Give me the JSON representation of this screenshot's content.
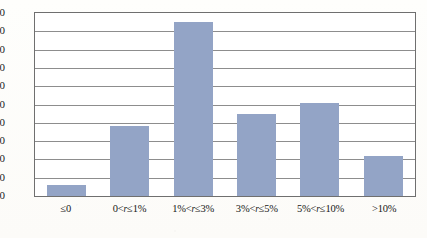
{
  "chart_data": {
    "type": "bar",
    "title": "",
    "subtitle": "",
    "xlabel": "",
    "ylabel": "",
    "categories": [
      "≤0",
      "0<r≤1%",
      "1%<r≤3%",
      "3%<r≤5%",
      "5%<r≤10%",
      ">10%"
    ],
    "category_parts": [
      {
        "pre": "≤0",
        "var": "",
        "post": ""
      },
      {
        "pre": "0<",
        "var": "r",
        "post": "≤1%"
      },
      {
        "pre": "1%<",
        "var": "r",
        "post": "≤3%"
      },
      {
        "pre": "3%<",
        "var": "r",
        "post": "≤5%"
      },
      {
        "pre": "5%<",
        "var": "r",
        "post": "≤10%"
      },
      {
        "pre": ">10%",
        "var": "",
        "post": ""
      }
    ],
    "values": [
      6,
      38,
      95,
      45,
      51,
      22
    ],
    "ylim": [
      0,
      100
    ],
    "ytick_labels": [
      "100",
      "90",
      "80",
      "70",
      "60",
      "50",
      "40",
      "30",
      "20",
      "10",
      "0"
    ],
    "ytick_values": [
      100,
      90,
      80,
      70,
      60,
      50,
      40,
      30,
      20,
      10,
      0
    ],
    "grid": true,
    "grid_axis": "y",
    "legend": false,
    "legend_position": "none",
    "bar_color": "#93a4c6",
    "grid_color": "#8d8d8d",
    "frame_color": "#6f6f6f",
    "background_color": "#ffffff"
  }
}
